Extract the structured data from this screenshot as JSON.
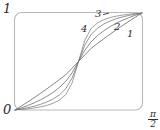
{
  "figure": {
    "name": "sigmoid-curve-family-plot",
    "background": "#ffffff",
    "frame_color": "#b9b9b9",
    "curve_color": "#6e6e6e"
  },
  "axes": {
    "y_max_label": "1",
    "origin_label": "0",
    "x_max_numerator": "π",
    "x_max_denominator": "2"
  },
  "curve_labels": {
    "one": "1",
    "two": "2",
    "three": "3",
    "four": "4"
  },
  "chart_data": {
    "type": "line",
    "title": "",
    "subtitle": "",
    "xlabel": "",
    "ylabel": "",
    "xlim": [
      0,
      1.5708
    ],
    "ylim": [
      0,
      1
    ],
    "x_tick_labels": [
      "0",
      "π/2"
    ],
    "y_tick_labels": [
      "0",
      "1"
    ],
    "grid": false,
    "legend": "inline-curve-numbers",
    "annotations": [
      "1",
      "2",
      "3",
      "4"
    ],
    "x": [
      0,
      0.0785,
      0.1571,
      0.2356,
      0.3142,
      0.3927,
      0.4712,
      0.5498,
      0.6283,
      0.7069,
      0.7854,
      0.8639,
      0.9425,
      1.021,
      1.0996,
      1.1781,
      1.2566,
      1.3352,
      1.4137,
      1.4923,
      1.5708
    ],
    "series": [
      {
        "name": "1",
        "label": "1",
        "values": [
          0,
          0.041,
          0.083,
          0.126,
          0.171,
          0.217,
          0.265,
          0.314,
          0.364,
          0.432,
          0.5,
          0.568,
          0.636,
          0.686,
          0.735,
          0.783,
          0.829,
          0.874,
          0.917,
          0.959,
          1.0
        ]
      },
      {
        "name": "2",
        "label": "2",
        "values": [
          0,
          0.022,
          0.046,
          0.073,
          0.104,
          0.14,
          0.182,
          0.233,
          0.296,
          0.384,
          0.5,
          0.616,
          0.704,
          0.767,
          0.818,
          0.86,
          0.896,
          0.927,
          0.954,
          0.978,
          1.0
        ]
      },
      {
        "name": "3",
        "label": "3",
        "values": [
          0,
          0.011,
          0.024,
          0.039,
          0.058,
          0.082,
          0.113,
          0.156,
          0.22,
          0.33,
          0.5,
          0.67,
          0.78,
          0.844,
          0.887,
          0.918,
          0.942,
          0.961,
          0.976,
          0.989,
          1.0
        ]
      },
      {
        "name": "4",
        "label": "4",
        "values": [
          0,
          0.005,
          0.012,
          0.021,
          0.032,
          0.047,
          0.069,
          0.102,
          0.159,
          0.28,
          0.5,
          0.72,
          0.841,
          0.898,
          0.931,
          0.953,
          0.968,
          0.979,
          0.988,
          0.995,
          1.0
        ]
      }
    ]
  }
}
